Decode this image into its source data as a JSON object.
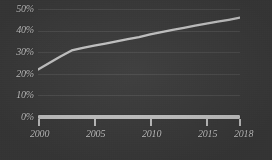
{
  "chart_data": {
    "type": "line",
    "title": "",
    "subtitle": "",
    "xlabel": "",
    "ylabel": "",
    "xlim": [
      2000,
      2018
    ],
    "ylim": [
      0,
      50
    ],
    "grid": true,
    "legend": "none",
    "y_ticks": [
      "0%",
      "10%",
      "20%",
      "30%",
      "40%",
      "50%"
    ],
    "y_tick_values": [
      0,
      10,
      20,
      30,
      40,
      50
    ],
    "x_ticks": [
      "2000",
      "2005",
      "2010",
      "2015",
      "2018"
    ],
    "x_tick_values": [
      2000,
      2005,
      2010,
      2015,
      2018
    ],
    "series": [
      {
        "name": "share",
        "color": "#d0d0d0",
        "x": [
          2000,
          2001,
          2002,
          2003,
          2004,
          2005,
          2006,
          2007,
          2008,
          2009,
          2010,
          2011,
          2012,
          2013,
          2014,
          2015,
          2016,
          2017,
          2018
        ],
        "values": [
          22.0,
          25.0,
          28.0,
          30.8,
          32.0,
          33.0,
          34.0,
          35.0,
          36.0,
          37.0,
          38.2,
          39.3,
          40.3,
          41.3,
          42.3,
          43.2,
          44.1,
          45.0,
          46.0
        ]
      }
    ]
  }
}
